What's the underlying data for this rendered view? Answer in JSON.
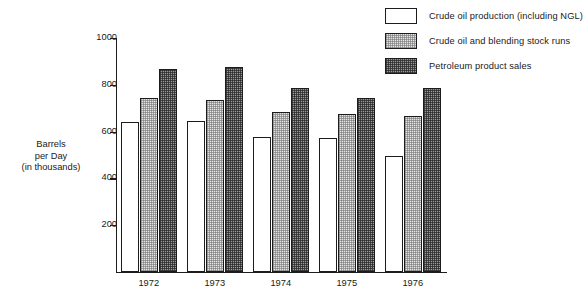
{
  "legend": {
    "items": [
      {
        "label": "Crude oil production (including NGL)",
        "swatch": "empty-swatch-icon",
        "fill": "empty"
      },
      {
        "label": "Crude oil and blending stock runs",
        "swatch": "light-hatch-swatch-icon",
        "fill": "light"
      },
      {
        "label": "Petroleum product sales",
        "swatch": "dark-hatch-swatch-icon",
        "fill": "dark"
      }
    ]
  },
  "axis": {
    "y_title_line1": "Barrels",
    "y_title_line2": "per Day",
    "y_title_line3": "(in thousands)",
    "y_ticks": [
      "1000",
      "800",
      "600",
      "400",
      "200"
    ]
  },
  "chart_data": {
    "type": "bar",
    "title": "",
    "subtitle": "",
    "xlabel": "",
    "ylabel": "Barrels per Day (in thousands)",
    "ylim": [
      0,
      1000
    ],
    "ytick_values": [
      200,
      400,
      600,
      800,
      1000
    ],
    "grid": false,
    "legend_position": "top-right",
    "categories": [
      "1972",
      "1973",
      "1974",
      "1975",
      "1976"
    ],
    "series": [
      {
        "name": "Crude oil production (including NGL)",
        "fill": "empty",
        "values": [
          640,
          645,
          578,
          572,
          497
        ]
      },
      {
        "name": "Crude oil and blending stock runs",
        "fill": "light",
        "values": [
          745,
          737,
          685,
          675,
          668
        ]
      },
      {
        "name": "Petroleum product sales",
        "fill": "dark",
        "values": [
          868,
          877,
          785,
          745,
          785
        ]
      }
    ]
  },
  "colors": {
    "axis": "#1c1c1c",
    "text": "#1a1a1a",
    "light_fill": "#e3e3e3",
    "dark_fill": "#9a9a9a",
    "background": "#ffffff"
  }
}
